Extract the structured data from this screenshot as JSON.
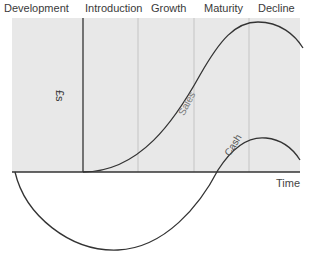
{
  "diagram": {
    "stages": [
      {
        "label": "Development",
        "x": 4
      },
      {
        "label": "Introduction",
        "x": 85
      },
      {
        "label": "Growth",
        "x": 151
      },
      {
        "label": "Maturity",
        "x": 204
      },
      {
        "label": "Decline",
        "x": 258
      }
    ],
    "y_axis_label": "£s",
    "x_axis_label": "Time",
    "curves": [
      {
        "name": "Sales",
        "label": "Sales"
      },
      {
        "name": "Cash",
        "label": "Cash"
      }
    ],
    "colors": {
      "shade": "#e8e8e8",
      "divider": "#c4c4c4",
      "axis": "#333333",
      "curve": "#333333",
      "text": "#3a3a3a"
    }
  }
}
